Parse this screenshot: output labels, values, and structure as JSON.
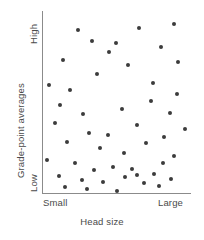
{
  "chart_data": {
    "type": "scatter",
    "title": "",
    "xlabel": "Head size",
    "ylabel": "Grade-point averages",
    "xticklabels": [
      "Small",
      "Large"
    ],
    "yticklabels": [
      "Low",
      "High"
    ],
    "xlim": [
      0,
      100
    ],
    "ylim": [
      0,
      100
    ],
    "grid": false,
    "legend": null,
    "annotation": "No association between head size and grade-point averages",
    "point_color": "#3c3c3c",
    "axis_color": "#8b8b8b",
    "series": [
      {
        "name": "students",
        "n": 49,
        "points": [
          [
            23.6,
            89.6
          ],
          [
            49.3,
            82.4
          ],
          [
            64.9,
            90.7
          ],
          [
            88.6,
            92.9
          ],
          [
            13.5,
            73.1
          ],
          [
            33.1,
            83.5
          ],
          [
            44.6,
            77.5
          ],
          [
            79.7,
            80.3
          ],
          [
            91.2,
            72.0
          ],
          [
            4.1,
            59.3
          ],
          [
            18.2,
            56.6
          ],
          [
            36.5,
            65.4
          ],
          [
            57.4,
            70.3
          ],
          [
            74.3,
            60.4
          ],
          [
            90.5,
            54.4
          ],
          [
            11.5,
            48.4
          ],
          [
            27.0,
            43.4
          ],
          [
            53.4,
            46.2
          ],
          [
            73.0,
            50.5
          ],
          [
            85.8,
            43.9
          ],
          [
            8.1,
            38.5
          ],
          [
            31.1,
            33.0
          ],
          [
            43.9,
            31.9
          ],
          [
            63.5,
            37.4
          ],
          [
            81.8,
            30.8
          ],
          [
            16.2,
            28.0
          ],
          [
            38.5,
            24.7
          ],
          [
            54.7,
            22.0
          ],
          [
            69.6,
            27.5
          ],
          [
            88.5,
            20.3
          ],
          [
            2.7,
            18.1
          ],
          [
            21.6,
            16.5
          ],
          [
            34.5,
            12.6
          ],
          [
            47.3,
            14.3
          ],
          [
            60.1,
            13.2
          ],
          [
            75.0,
            10.4
          ],
          [
            81.1,
            16.5
          ],
          [
            10.8,
            9.3
          ],
          [
            26.4,
            7.1
          ],
          [
            40.5,
            6.0
          ],
          [
            55.4,
            8.8
          ],
          [
            68.2,
            5.5
          ],
          [
            86.5,
            7.7
          ],
          [
            14.9,
            3.3
          ],
          [
            29.7,
            2.2
          ],
          [
            50.0,
            1.1
          ],
          [
            63.5,
            9.9
          ],
          [
            78.4,
            3.8
          ],
          [
            95.9,
            35.2
          ]
        ]
      }
    ]
  },
  "axes": {
    "y_title": "Grade-point averages",
    "y_tick_high": "High",
    "y_tick_low": "Low",
    "x_title": "Head size",
    "x_tick_small": "Small",
    "x_tick_large": "Large"
  }
}
